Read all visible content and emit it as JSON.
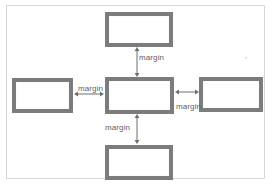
{
  "diagram": {
    "stroke_color": "#7c7c7c",
    "fill_color": "#ffffff",
    "frame_color": "#d8d8d8",
    "label_color": "#5e5e5e",
    "boxes": [
      {
        "id": "top",
        "name": "top-box",
        "label": ""
      },
      {
        "id": "center",
        "name": "center-box",
        "label": ""
      },
      {
        "id": "left",
        "name": "left-box",
        "label": ""
      },
      {
        "id": "right",
        "name": "right-box",
        "label": ""
      },
      {
        "id": "bottom",
        "name": "bottom-box",
        "label": ""
      }
    ],
    "arrows": [
      {
        "id": "top",
        "direction": "vertical",
        "label": "margin",
        "label_position": "right"
      },
      {
        "id": "left",
        "direction": "horizontal",
        "label": "margin",
        "label_position": "above"
      },
      {
        "id": "right",
        "direction": "horizontal",
        "label": "margin",
        "label_position": "below"
      },
      {
        "id": "bottom",
        "direction": "vertical",
        "label": "margin",
        "label_position": "left"
      }
    ],
    "labels": {
      "top": "margin",
      "left": "margin",
      "right": "margin",
      "bottom": "margin"
    }
  }
}
